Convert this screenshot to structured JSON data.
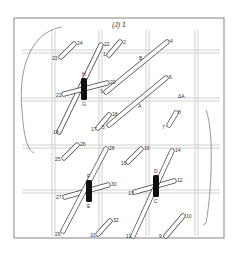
{
  "figure": {
    "title": "(J) 1",
    "frame": {
      "x": 14,
      "y": 18,
      "w": 210,
      "h": 220,
      "stroke": "#999999"
    },
    "grid": {
      "vertical_pairs": [
        52,
        99,
        146,
        195
      ],
      "horizontal_pairs": [
        50,
        98,
        145,
        190
      ],
      "line_color": "#bdbdbd"
    },
    "strands": [
      {
        "from": "1",
        "to": "2",
        "x1": 109,
        "y1": 55,
        "x2": 120,
        "y2": 42
      },
      {
        "from": "3",
        "to": "4",
        "x1": 106,
        "y1": 92,
        "x2": 167,
        "y2": 42
      },
      {
        "from": "5",
        "to": "6",
        "x1": 109,
        "y1": 125,
        "x2": 166,
        "y2": 78
      },
      {
        "from": "7",
        "to": "8",
        "x1": 169,
        "y1": 125,
        "x2": 176,
        "y2": 113
      },
      {
        "from": "9",
        "to": "10",
        "x1": 166,
        "y1": 236,
        "x2": 183,
        "y2": 216
      },
      {
        "from": "13",
        "to": "12",
        "x1": 135,
        "y1": 192,
        "x2": 174,
        "y2": 181
      },
      {
        "from": "11",
        "to": "14",
        "x1": 133,
        "y1": 236,
        "x2": 172,
        "y2": 151
      },
      {
        "from": "15",
        "to": "16",
        "x1": 128,
        "y1": 162,
        "x2": 141,
        "y2": 149
      },
      {
        "from": "17",
        "to": "18",
        "x1": 98,
        "y1": 128,
        "x2": 109,
        "y2": 115
      },
      {
        "from": "19",
        "to": "22",
        "x1": 59,
        "y1": 132,
        "x2": 101,
        "y2": 45
      },
      {
        "from": "21",
        "to": "20",
        "x1": 64,
        "y1": 94,
        "x2": 107,
        "y2": 83
      },
      {
        "from": "23",
        "to": "24",
        "x1": 61,
        "y1": 57,
        "x2": 74,
        "y2": 44
      },
      {
        "from": "25",
        "to": "26",
        "x1": 64,
        "y1": 158,
        "x2": 77,
        "y2": 145
      },
      {
        "from": "27",
        "to": "30",
        "x1": 65,
        "y1": 197,
        "x2": 108,
        "y2": 185
      },
      {
        "from": "29",
        "to": "28",
        "x1": 63,
        "y1": 231,
        "x2": 106,
        "y2": 149
      },
      {
        "from": "31",
        "to": "32",
        "x1": 98,
        "y1": 234,
        "x2": 110,
        "y2": 221
      }
    ],
    "clamps": [
      {
        "top": "H",
        "bottom": "G",
        "x": 81,
        "y": 78,
        "w": 6,
        "h": 22
      },
      {
        "top": "F",
        "bottom": "E",
        "x": 86,
        "y": 180,
        "w": 6,
        "h": 22
      },
      {
        "top": "D",
        "bottom": "C",
        "x": 153,
        "y": 175,
        "w": 6,
        "h": 22
      }
    ],
    "labels": [
      {
        "text": "1",
        "x": 103,
        "y": 56
      },
      {
        "text": "2",
        "x": 123,
        "y": 44
      },
      {
        "text": "3",
        "x": 100,
        "y": 93
      },
      {
        "text": "4",
        "x": 170,
        "y": 43
      },
      {
        "text": "5",
        "x": 102,
        "y": 129
      },
      {
        "text": "6",
        "x": 169,
        "y": 79
      },
      {
        "text": "7",
        "x": 162,
        "y": 129
      },
      {
        "text": "8",
        "x": 178,
        "y": 114
      },
      {
        "text": "9",
        "x": 159,
        "y": 238
      },
      {
        "text": "10",
        "x": 186,
        "y": 218
      },
      {
        "text": "11",
        "x": 126,
        "y": 238
      },
      {
        "text": "12",
        "x": 177,
        "y": 182
      },
      {
        "text": "13",
        "x": 128,
        "y": 195
      },
      {
        "text": "14",
        "x": 175,
        "y": 152
      },
      {
        "text": "15",
        "x": 121,
        "y": 165
      },
      {
        "text": "16",
        "x": 144,
        "y": 150
      },
      {
        "text": "17",
        "x": 91,
        "y": 131
      },
      {
        "text": "18",
        "x": 112,
        "y": 116
      },
      {
        "text": "19",
        "x": 53,
        "y": 134
      },
      {
        "text": "20",
        "x": 110,
        "y": 84
      },
      {
        "text": "21",
        "x": 56,
        "y": 97
      },
      {
        "text": "22",
        "x": 104,
        "y": 46
      },
      {
        "text": "23",
        "x": 52,
        "y": 60
      },
      {
        "text": "24",
        "x": 77,
        "y": 45
      },
      {
        "text": "25",
        "x": 55,
        "y": 161
      },
      {
        "text": "26",
        "x": 80,
        "y": 146
      },
      {
        "text": "27",
        "x": 56,
        "y": 199
      },
      {
        "text": "28",
        "x": 109,
        "y": 150
      },
      {
        "text": "29",
        "x": 55,
        "y": 236
      },
      {
        "text": "30",
        "x": 111,
        "y": 186
      },
      {
        "text": "31",
        "x": 90,
        "y": 237
      },
      {
        "text": "32",
        "x": 113,
        "y": 222
      },
      {
        "text": "B",
        "x": 139,
        "y": 60
      },
      {
        "text": "A",
        "x": 138,
        "y": 108
      },
      {
        "text": "ΔA",
        "x": 178,
        "y": 98
      }
    ]
  }
}
